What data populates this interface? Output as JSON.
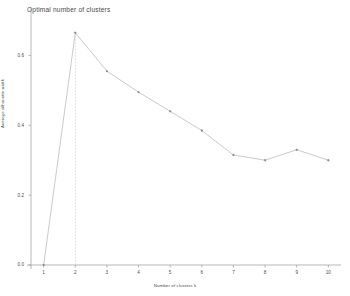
{
  "chart_data": {
    "type": "line",
    "title": "Optimal number of clusters",
    "xlabel": "Number of clusters k",
    "ylabel": "Average silhouette width",
    "x": [
      1,
      2,
      3,
      4,
      5,
      6,
      7,
      8,
      9,
      10
    ],
    "values": [
      0.0,
      0.665,
      0.555,
      0.495,
      0.44,
      0.385,
      0.315,
      0.3,
      0.33,
      0.3
    ],
    "categories": [
      "1",
      "2",
      "3",
      "4",
      "5",
      "6",
      "7",
      "8",
      "9",
      "10"
    ],
    "series": [
      {
        "name": "Average silhouette width",
        "values": [
          0.0,
          0.665,
          0.555,
          0.495,
          0.44,
          0.385,
          0.315,
          0.3,
          0.33,
          0.3
        ]
      }
    ],
    "xtick_labels": [
      "1",
      "2",
      "3",
      "4",
      "5",
      "6",
      "7",
      "8",
      "9",
      "10"
    ],
    "ytick_labels": [
      "0.0",
      "0.2",
      "0.4",
      "0.6"
    ],
    "ytick_values": [
      0.0,
      0.2,
      0.4,
      0.6
    ],
    "xlim": [
      0.6,
      10.4
    ],
    "ylim": [
      0.0,
      0.69
    ],
    "grid": false,
    "legend": "none",
    "annotations": [
      {
        "type": "vertical-dashed-line",
        "at_x": 2,
        "label": "optimal k = 2"
      }
    ],
    "marker": "point",
    "line_color": "#bfbfbf",
    "marker_color": "#8a8a8a",
    "axis_color": "#9a9a9a",
    "dashed_line_color": "#c9c9c9",
    "background_color": "#ffffff"
  },
  "axes": {
    "title": "Optimal number of clusters",
    "x_axis_title": "Number of clusters k",
    "y_axis_title": "Average silhouette width"
  }
}
